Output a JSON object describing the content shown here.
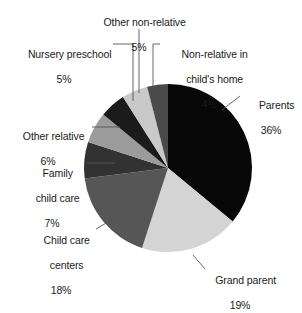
{
  "figure": {
    "background_color": "#ffffff",
    "text_color": "#1a1a1a"
  },
  "chart_data": {
    "type": "pie",
    "title": "",
    "subtitle": "",
    "xlabel": "",
    "ylabel": "",
    "legend_position": "none",
    "grid": false,
    "units": "percent",
    "start_angle_deg": 0,
    "direction": "clockwise",
    "categories": [
      "Parents",
      "Grand parent",
      "Child care centers",
      "Family child care",
      "Other relative",
      "Nursery preschool",
      "Other non-relative",
      "Non-relative in child's home"
    ],
    "values": [
      36,
      19,
      18,
      7,
      6,
      5,
      5,
      4
    ],
    "value_labels": [
      "36%",
      "19%",
      "18%",
      "7%",
      "6%",
      "5%",
      "5%",
      "4%"
    ],
    "colors": [
      "#070707",
      "#d4d4d4",
      "#565656",
      "#323232",
      "#9b9b9b",
      "#1b1b1b",
      "#c9c9c9",
      "#4a4a4a"
    ],
    "slices": [
      {
        "label": "Parents",
        "value": 36,
        "value_label": "36%",
        "color": "#070707"
      },
      {
        "label": "Grand parent",
        "value": 19,
        "value_label": "19%",
        "color": "#d4d4d4"
      },
      {
        "label": "Child care centers",
        "value": 18,
        "value_label": "18%",
        "color": "#565656"
      },
      {
        "label": "Family child care",
        "value": 7,
        "value_label": "7%",
        "color": "#323232"
      },
      {
        "label": "Other relative",
        "value": 6,
        "value_label": "6%",
        "color": "#9b9b9b"
      },
      {
        "label": "Nursery preschool",
        "value": 5,
        "value_label": "5%",
        "color": "#1b1b1b"
      },
      {
        "label": "Other non-relative",
        "value": 5,
        "value_label": "5%",
        "color": "#c9c9c9"
      },
      {
        "label": "Non-relative in child's home",
        "value": 4,
        "value_label": "4%",
        "color": "#4a4a4a"
      }
    ]
  },
  "labels": {
    "other_nonrelative": {
      "line1": "Other non-relative",
      "pct": "5%"
    },
    "nursery_preschool": {
      "line1": "Nursery preschool",
      "pct": "5%"
    },
    "nonrelative_home": {
      "line1": "Non-relative in",
      "line2": "child's home",
      "pct": "4%"
    },
    "parents": {
      "line1": "Parents",
      "pct": "36%"
    },
    "other_relative": {
      "line1": "Other relative",
      "pct": "6%"
    },
    "family_child_care": {
      "line1": "Family",
      "line2": "child care",
      "pct": "7%"
    },
    "child_care_centers": {
      "line1": "Child care",
      "line2": "centers",
      "pct": "18%"
    },
    "grand_parent": {
      "line1": "Grand parent",
      "pct": "19%"
    }
  }
}
